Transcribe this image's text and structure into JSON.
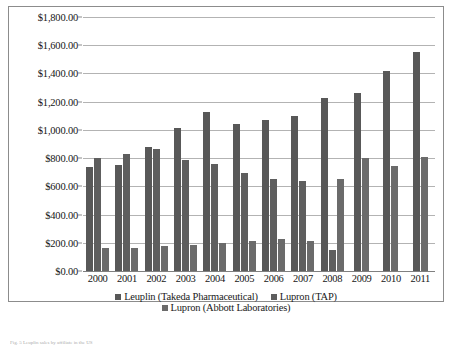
{
  "chart_data": {
    "type": "bar",
    "title": "",
    "xlabel": "",
    "ylabel": "",
    "ylim": [
      0,
      1800
    ],
    "ytick_step": 200,
    "grid": true,
    "legend_position": "bottom",
    "currency_prefix": "$",
    "categories": [
      "2000",
      "2001",
      "2002",
      "2003",
      "2004",
      "2005",
      "2006",
      "2007",
      "2008",
      "2009",
      "2010",
      "2011"
    ],
    "ytick_labels": [
      "$0.00",
      "$200.00",
      "$400.00",
      "$600.00",
      "$800.00",
      "$1,000.00",
      "$1,200.00",
      "$1,400.00",
      "$1,600.00",
      "$1,800.00"
    ],
    "series": [
      {
        "name": "Leuplin (Takeda Pharmaceutical)",
        "color": "#585858",
        "values": [
          735,
          750,
          880,
          1010,
          1125,
          1040,
          1070,
          1100,
          1225,
          1265,
          1420,
          1555
        ]
      },
      {
        "name": "Lupron (TAP)",
        "color": "#5e5e5e",
        "values": [
          800,
          830,
          865,
          790,
          760,
          695,
          655,
          635,
          150,
          null,
          null,
          null
        ]
      },
      {
        "name": "Lupron (Abbott Laboratories)",
        "color": "#6b6b6b",
        "values": [
          160,
          165,
          175,
          185,
          200,
          215,
          230,
          210,
          650,
          800,
          745,
          805
        ]
      }
    ]
  },
  "legend": {
    "items": [
      {
        "label": "Leuplin (Takeda Pharmaceutical)",
        "swatch": "s1"
      },
      {
        "label": "Lupron (TAP)",
        "swatch": "s2"
      },
      {
        "label": "Lupron (Abbott Laboratories)",
        "swatch": "s3"
      }
    ]
  },
  "caption": {
    "text": "Fig. 5  Leuplin sales by affiliate in the US"
  }
}
